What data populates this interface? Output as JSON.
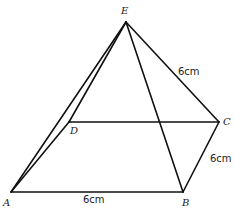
{
  "diagram": {
    "type": "square-based pyramid",
    "vertices": {
      "A": {
        "label": "A",
        "x": 11,
        "y": 192,
        "lx": 3,
        "ly": 206
      },
      "B": {
        "label": "B",
        "x": 183,
        "y": 192,
        "lx": 182,
        "ly": 206
      },
      "C": {
        "label": "C",
        "x": 219,
        "y": 122,
        "lx": 223,
        "ly": 125
      },
      "D": {
        "label": "D",
        "x": 69,
        "y": 122,
        "lx": 70,
        "ly": 134
      },
      "E": {
        "label": "E",
        "x": 126,
        "y": 22,
        "lx": 121,
        "ly": 14
      }
    },
    "edges": [
      [
        "A",
        "B"
      ],
      [
        "B",
        "C"
      ],
      [
        "D",
        "C"
      ],
      [
        "A",
        "D"
      ],
      [
        "A",
        "E"
      ],
      [
        "D",
        "E"
      ],
      [
        "E",
        "C"
      ],
      [
        "E",
        "B"
      ]
    ],
    "measurements": {
      "ab": {
        "text": "6cm",
        "x": 83,
        "y": 203
      },
      "bc": {
        "text": "6cm",
        "x": 210,
        "y": 162
      },
      "ec": {
        "text": "6cm",
        "x": 178,
        "y": 75
      }
    },
    "line_color": "#111111"
  }
}
